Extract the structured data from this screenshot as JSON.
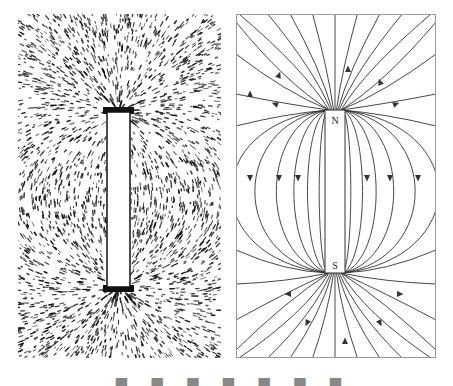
{
  "figure": {
    "left_panel": {
      "name": "iron-filings-photo",
      "description": "Iron filings aligned around a bar magnet",
      "colors": {
        "filings": "#111111",
        "background": "#ffffff"
      }
    },
    "right_panel": {
      "name": "magnetic-field-lines-diagram",
      "magnet": {
        "north_label": "N",
        "south_label": "S"
      },
      "colors": {
        "lines": "#333333",
        "border": "#999999",
        "magnet_fill": "#ffffff"
      }
    },
    "caption_clipped": "▄ ▀▄ ▀ ▄▀▄ ▀▄ ▀ ▄▀▄ ▀▄"
  }
}
